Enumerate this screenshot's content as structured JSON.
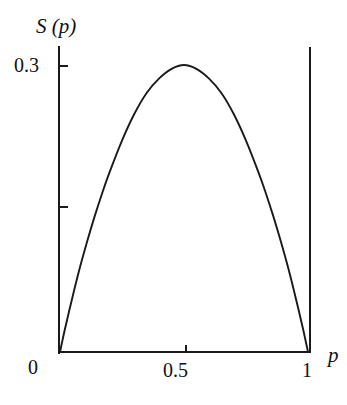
{
  "chart_data": {
    "type": "line",
    "title": "",
    "subtitle": "",
    "xlabel": "p",
    "ylabel": "S (p)",
    "grid": false,
    "legend": null,
    "xlim": [
      0,
      1
    ],
    "ylim": [
      0,
      0.33
    ],
    "x_ticks": [
      {
        "value": 0,
        "label": "0"
      },
      {
        "value": 0.5,
        "label": "0.5"
      },
      {
        "value": 1,
        "label": "1"
      }
    ],
    "y_ticks": [
      {
        "value": 0.3,
        "label": "0.3"
      },
      {
        "value": 0.15,
        "label": ""
      }
    ],
    "annotations": [],
    "series": [
      {
        "name": "S(p)",
        "color": "#1a1a1a",
        "x": [
          0.0,
          0.02,
          0.05,
          0.08,
          0.11,
          0.14,
          0.17,
          0.2,
          0.25,
          0.3,
          0.35,
          0.4,
          0.45,
          0.5,
          0.55,
          0.6,
          0.65,
          0.7,
          0.75,
          0.8,
          0.83,
          0.86,
          0.89,
          0.92,
          0.95,
          0.98,
          1.0
        ],
        "y": [
          0.0,
          0.024,
          0.057,
          0.088,
          0.116,
          0.142,
          0.166,
          0.188,
          0.221,
          0.249,
          0.271,
          0.286,
          0.296,
          0.3,
          0.296,
          0.286,
          0.271,
          0.249,
          0.221,
          0.188,
          0.166,
          0.142,
          0.116,
          0.088,
          0.057,
          0.024,
          0.0
        ]
      }
    ]
  },
  "labels": {
    "y_axis_title": "S (p)",
    "x_axis_title": "p",
    "y_tick_03": "0.3",
    "x_tick_0": "0",
    "x_tick_05": "0.5",
    "x_tick_1": "1"
  },
  "style": {
    "line_color": "#1a1a1a",
    "axis_color": "#1a1a1a",
    "background": "#ffffff"
  }
}
